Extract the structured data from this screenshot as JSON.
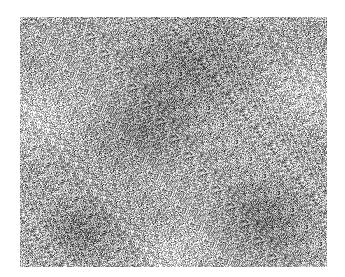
{
  "image": {
    "kind": "grayscale speckle texture",
    "background": "#ffffff",
    "region": {
      "x": 20,
      "y": 17,
      "width": 307,
      "height": 250
    },
    "tones": {
      "light": "#f2f2f2",
      "mid": "#a8a8a8",
      "dark": "#3a3a3a"
    },
    "dark_clusters": [
      {
        "cx": 0.55,
        "cy": 0.2,
        "r": 0.25
      },
      {
        "cx": 0.4,
        "cy": 0.45,
        "r": 0.2
      },
      {
        "cx": 0.8,
        "cy": 0.8,
        "r": 0.2
      },
      {
        "cx": 0.2,
        "cy": 0.85,
        "r": 0.15
      }
    ],
    "light_regions": [
      {
        "cx": 0.05,
        "cy": 0.4,
        "r": 0.2
      },
      {
        "cx": 0.95,
        "cy": 0.3,
        "r": 0.2
      },
      {
        "cx": 0.5,
        "cy": 0.95,
        "r": 0.15
      }
    ]
  }
}
